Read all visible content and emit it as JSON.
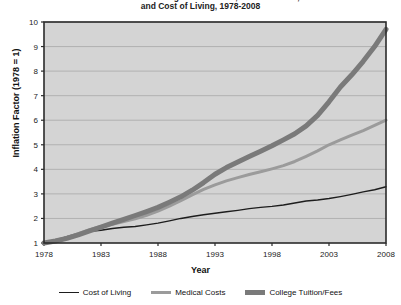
{
  "chart_data": {
    "type": "line",
    "title": "Increases in College Tuition/Fees, Medical Costs,\nand Cost of Living, 1978-2008",
    "xlabel": "Year",
    "ylabel": "Inflation Factor (1978 = 1)",
    "xlim": [
      1978,
      2008
    ],
    "ylim": [
      1,
      10
    ],
    "grid": true,
    "legend_position": "bottom",
    "xticks": [
      "1978",
      "1983",
      "1988",
      "1993",
      "1998",
      "2003",
      "2008"
    ],
    "yticks": [
      "1",
      "2",
      "3",
      "4",
      "5",
      "6",
      "7",
      "8",
      "9",
      "10"
    ],
    "x": [
      1978,
      1979,
      1980,
      1981,
      1982,
      1983,
      1984,
      1985,
      1986,
      1987,
      1988,
      1989,
      1990,
      1991,
      1992,
      1993,
      1994,
      1995,
      1996,
      1997,
      1998,
      1999,
      2000,
      2001,
      2002,
      2003,
      2004,
      2005,
      2006,
      2007,
      2008
    ],
    "series": [
      {
        "name": "Cost of Living",
        "color": "#1d1d1d",
        "width": 1.4,
        "values": [
          1.0,
          1.11,
          1.26,
          1.39,
          1.48,
          1.52,
          1.59,
          1.64,
          1.67,
          1.74,
          1.81,
          1.9,
          2.0,
          2.08,
          2.15,
          2.21,
          2.27,
          2.33,
          2.4,
          2.45,
          2.49,
          2.55,
          2.63,
          2.71,
          2.75,
          2.81,
          2.89,
          2.98,
          3.08,
          3.17,
          3.29
        ]
      },
      {
        "name": "Medical Costs",
        "color": "#9b9b9b",
        "width": 3.0,
        "values": [
          1.0,
          1.1,
          1.23,
          1.38,
          1.54,
          1.67,
          1.76,
          1.87,
          1.99,
          2.13,
          2.3,
          2.5,
          2.72,
          2.96,
          3.18,
          3.37,
          3.53,
          3.66,
          3.79,
          3.9,
          4.02,
          4.15,
          4.32,
          4.53,
          4.75,
          5.0,
          5.2,
          5.39,
          5.58,
          5.79,
          6.0
        ]
      },
      {
        "name": "College Tuition/Fees",
        "color": "#7a7a7a",
        "width": 5.0,
        "values": [
          1.0,
          1.08,
          1.19,
          1.33,
          1.49,
          1.65,
          1.81,
          1.96,
          2.12,
          2.28,
          2.45,
          2.66,
          2.88,
          3.15,
          3.46,
          3.8,
          4.07,
          4.3,
          4.52,
          4.74,
          4.96,
          5.2,
          5.45,
          5.77,
          6.2,
          6.75,
          7.35,
          7.85,
          8.4,
          9.0,
          9.7
        ]
      }
    ]
  },
  "plot_area": {
    "left": 44,
    "top": 22,
    "right": 386,
    "bottom": 243,
    "bg": "#d4d4d4",
    "gridline_color": "#a8a8a8",
    "border_color": "#2b2b2b"
  },
  "legend": {
    "items": [
      {
        "label": "Cost of Living",
        "color": "#1d1d1d",
        "width": 1.5
      },
      {
        "label": "Medical Costs",
        "color": "#9b9b9b",
        "width": 3
      },
      {
        "label": "College Tuition/Fees",
        "color": "#7a7a7a",
        "width": 5
      }
    ]
  }
}
